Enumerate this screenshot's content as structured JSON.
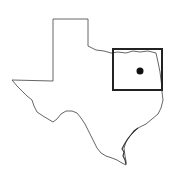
{
  "map": {
    "region": "Texas",
    "outline_color": "#555555",
    "highlight_box": {
      "x": 113,
      "y": 49,
      "width": 49,
      "height": 41,
      "color": "#222222"
    },
    "marker": {
      "cx": 140,
      "cy": 71,
      "r": 3.5,
      "color": "#111111"
    }
  }
}
